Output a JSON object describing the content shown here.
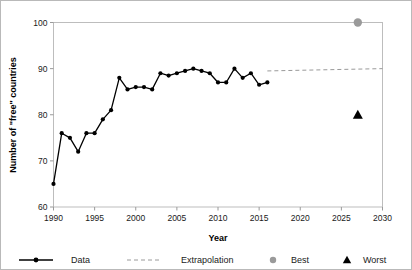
{
  "chart_data": {
    "type": "line",
    "title": "",
    "xlabel": "Year",
    "ylabel": "Number of \"free\" countries",
    "xlim": [
      1990,
      2030
    ],
    "ylim": [
      60,
      100
    ],
    "xticks": [
      1990,
      1995,
      2000,
      2005,
      2010,
      2015,
      2020,
      2025,
      2030
    ],
    "xtick_labels": [
      "1990",
      "1995",
      "2000",
      "2005",
      "2010",
      "2015",
      "2020",
      "2025",
      "2030"
    ],
    "yticks": [
      60,
      70,
      80,
      90,
      100
    ],
    "ytick_labels": [
      "60",
      "70",
      "80",
      "90",
      "100"
    ],
    "grid": false,
    "legend_position": "below",
    "series": [
      {
        "name": "Data",
        "type": "line-marker",
        "color": "#000000",
        "x": [
          1990,
          1991,
          1992,
          1993,
          1994,
          1995,
          1996,
          1997,
          1998,
          1999,
          2000,
          2001,
          2002,
          2003,
          2004,
          2005,
          2006,
          2007,
          2008,
          2009,
          2010,
          2011,
          2012,
          2013,
          2014,
          2015,
          2016
        ],
        "values": [
          65,
          76,
          75,
          72,
          76,
          76,
          79,
          81,
          88,
          85.5,
          86,
          86,
          85.5,
          89,
          88.5,
          89,
          89.5,
          90,
          89.5,
          89,
          87,
          87,
          90,
          88,
          89,
          86.5,
          87
        ]
      },
      {
        "name": "Extrapolation",
        "type": "dashed-line",
        "color": "#9a9a9a",
        "x": [
          2016,
          2030
        ],
        "values": [
          89.5,
          90
        ]
      },
      {
        "name": "Best",
        "type": "point-circle",
        "color": "#9a9a9a",
        "x": [
          2027
        ],
        "values": [
          100
        ]
      },
      {
        "name": "Worst",
        "type": "point-triangle",
        "color": "#000000",
        "x": [
          2027
        ],
        "values": [
          80
        ]
      }
    ],
    "legend": [
      {
        "label": "Data",
        "marker": "line-with-dot",
        "color": "#000000"
      },
      {
        "label": "Extrapolation",
        "marker": "dashed-line",
        "color": "#9a9a9a"
      },
      {
        "label": "Best",
        "marker": "circle",
        "color": "#9a9a9a"
      },
      {
        "label": "Worst",
        "marker": "triangle",
        "color": "#000000"
      }
    ]
  }
}
